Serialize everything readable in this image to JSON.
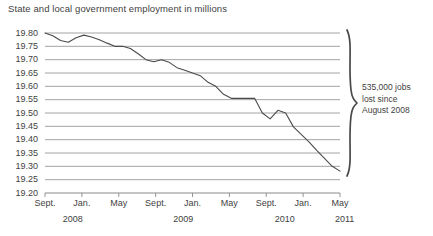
{
  "chart_data": {
    "type": "line",
    "title": "State and local government employment in millions",
    "xlabel": "",
    "ylabel": "",
    "ylim": [
      19.2,
      19.8
    ],
    "ytick_step": 0.05,
    "ytick_labels": [
      "19.80",
      "19.75",
      "19.70",
      "19.65",
      "19.60",
      "19.55",
      "19.50",
      "19.45",
      "19.40",
      "19.35",
      "19.30",
      "19.25",
      "19.20"
    ],
    "ytick_values": [
      19.8,
      19.75,
      19.7,
      19.65,
      19.6,
      19.55,
      19.5,
      19.45,
      19.4,
      19.35,
      19.3,
      19.25,
      19.2
    ],
    "grid": true,
    "legend": "none",
    "xtick_labels": [
      "Sept.",
      "Jan.",
      "May",
      "Sept.",
      "Jan.",
      "May",
      "Sept.",
      "Jan.",
      "May"
    ],
    "xtick_months": [
      0,
      4,
      8,
      12,
      16,
      20,
      24,
      28,
      32
    ],
    "year_group_labels": [
      "2008",
      "2009",
      "2010",
      "2011"
    ],
    "year_group_months": [
      0,
      12,
      24,
      32
    ],
    "x_start_label": "Sept. 2008",
    "x_end_label": "May 2011",
    "series": [
      {
        "name": "State and local government employment",
        "color": "#4a4a4a",
        "x_months": [
          0,
          1,
          2,
          3,
          4,
          5,
          6,
          7,
          8,
          9,
          10,
          11,
          12,
          13,
          14,
          15,
          16,
          17,
          18,
          19,
          20,
          21,
          22,
          23,
          24,
          25,
          26,
          27,
          28,
          29,
          30,
          31,
          32
        ],
        "x_labels": [
          "Sept. 2008",
          "Oct. 2008",
          "Nov. 2008",
          "Dec. 2008",
          "Jan. 2009",
          "Feb. 2009",
          "Mar. 2009",
          "Apr. 2009",
          "May 2009",
          "June 2009",
          "July 2009",
          "Aug. 2009",
          "Sept. 2009",
          "Oct. 2009",
          "Nov. 2009",
          "Dec. 2009",
          "Jan. 2010",
          "Feb. 2010",
          "Mar. 2010",
          "Apr. 2010",
          "May 2010",
          "June 2010",
          "July 2010",
          "Aug. 2010",
          "Sept. 2010",
          "Oct. 2010",
          "Nov. 2010",
          "Dec. 2010",
          "Jan. 2011",
          "Feb. 2011",
          "Mar. 2011",
          "Apr. 2011",
          "May 2011"
        ],
        "values": [
          19.8,
          19.79,
          19.772,
          19.765,
          19.782,
          19.792,
          19.785,
          19.775,
          19.762,
          19.75,
          19.75,
          19.742,
          19.722,
          19.7,
          19.692,
          19.7,
          19.69,
          19.67,
          19.66,
          19.65,
          19.64,
          19.615,
          19.6,
          19.57,
          19.555,
          19.555,
          19.555,
          19.555,
          19.5,
          19.478,
          19.51,
          19.5,
          19.448,
          19.42,
          19.392,
          19.36,
          19.33,
          19.3,
          19.282
        ]
      }
    ],
    "annotation": {
      "line1": "535,000 jobs",
      "line2": "lost since",
      "line3": "August 2008",
      "bracket": "curly-brace-right"
    }
  },
  "caption": ""
}
